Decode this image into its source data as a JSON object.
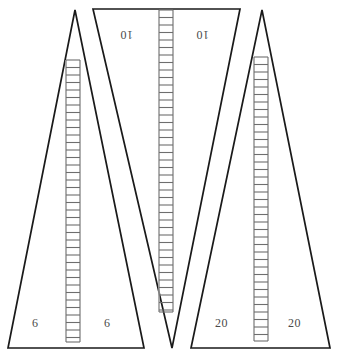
{
  "figure": {
    "type": "geometry-diagram",
    "background_color": "#ffffff",
    "stroke_color": "#1a1a1a",
    "label_color": "#4a4a4a",
    "ladder_rail_color": "#9a9a9a",
    "ladder_rung_color": "#6e6e6e",
    "width": 342,
    "height": 358
  },
  "shapes": {
    "left_triangle": {
      "name": "left-upright-triangle",
      "orientation": "apex-up",
      "apex": {
        "x": 75,
        "y": 10
      },
      "base_left": {
        "x": 8,
        "y": 348
      },
      "base_right": {
        "x": 144,
        "y": 348
      }
    },
    "middle_triangle": {
      "name": "middle-inverted-triangle",
      "orientation": "apex-down",
      "apex": {
        "x": 172,
        "y": 348
      },
      "top_left": {
        "x": 93,
        "y": 9
      },
      "top_right": {
        "x": 240,
        "y": 9
      }
    },
    "right_triangle": {
      "name": "right-upright-triangle",
      "orientation": "apex-up",
      "apex": {
        "x": 262,
        "y": 10
      },
      "base_left": {
        "x": 191,
        "y": 348
      },
      "base_right": {
        "x": 330,
        "y": 348
      }
    }
  },
  "ladders": [
    {
      "name": "left-ladder",
      "x": 66,
      "y_top": 60,
      "y_bottom": 342,
      "width": 14,
      "rung_spacing": 7.5
    },
    {
      "name": "middle-ladder",
      "x": 159,
      "y_top": 10,
      "y_bottom": 312,
      "width": 14,
      "rung_spacing": 7.5
    },
    {
      "name": "right-ladder",
      "x": 254,
      "y_top": 57,
      "y_bottom": 341,
      "width": 14,
      "rung_spacing": 7.5
    }
  ],
  "labels": [
    {
      "id": "left_ten",
      "name": "dimension-label-10-left",
      "text": "10",
      "x": 120,
      "y": 27,
      "rotated": true
    },
    {
      "id": "right_ten",
      "name": "dimension-label-10-right",
      "text": "10",
      "x": 196,
      "y": 27,
      "rotated": true
    },
    {
      "id": "left_six",
      "name": "dimension-label-6-left",
      "text": "6",
      "x": 32,
      "y": 316,
      "rotated": false
    },
    {
      "id": "right_six",
      "name": "dimension-label-6-right",
      "text": "6",
      "x": 104,
      "y": 316,
      "rotated": false
    },
    {
      "id": "left_twenty",
      "name": "dimension-label-20-left",
      "text": "20",
      "x": 215,
      "y": 316,
      "rotated": false
    },
    {
      "id": "right_twenty",
      "name": "dimension-label-20-right",
      "text": "20",
      "x": 288,
      "y": 316,
      "rotated": false
    }
  ],
  "chart_data": {
    "type": "diagram",
    "title": "",
    "annotations": [
      "10",
      "10",
      "6",
      "6",
      "20",
      "20"
    ],
    "elements": [
      "upright triangle with ladder",
      "inverted triangle with ladder",
      "upright triangle with ladder"
    ]
  }
}
